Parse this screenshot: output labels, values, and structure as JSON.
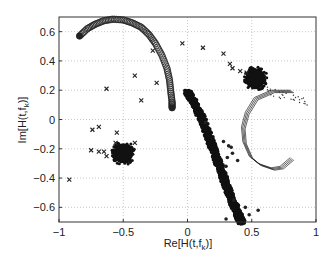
{
  "chart_data": {
    "type": "scatter",
    "title": "",
    "xlabel": "Re[H(t,f_k)]",
    "ylabel": "Im[H(t,f_k)]",
    "xlim": [
      -1,
      1
    ],
    "ylim": [
      -0.7,
      0.7
    ],
    "xticks": [
      -1,
      -0.5,
      0,
      0.5,
      1
    ],
    "xtick_labels": [
      "−1",
      "−0.5",
      "0",
      "0.5",
      "1"
    ],
    "yticks": [
      0.6,
      0.4,
      0.2,
      0,
      -0.2,
      -0.4,
      -0.6
    ],
    "ytick_labels": [
      "0.6",
      "0.4",
      "0.2",
      "0",
      "−0.2",
      "−0.4",
      "−0.6"
    ],
    "grid": true,
    "legend": null,
    "series": [
      {
        "name": "arc-circles",
        "marker": "o",
        "description": "Dense arc of open circles from about (-0.84, 0.57) over the top near (-0.55, 0.68) down to (-0.12, 0.08)",
        "points": [
          [
            -0.84,
            0.57
          ],
          [
            -0.78,
            0.62
          ],
          [
            -0.72,
            0.65
          ],
          [
            -0.65,
            0.675
          ],
          [
            -0.58,
            0.685
          ],
          [
            -0.5,
            0.68
          ],
          [
            -0.43,
            0.66
          ],
          [
            -0.36,
            0.63
          ],
          [
            -0.3,
            0.58
          ],
          [
            -0.25,
            0.52
          ],
          [
            -0.2,
            0.44
          ],
          [
            -0.16,
            0.35
          ],
          [
            -0.14,
            0.27
          ],
          [
            -0.13,
            0.19
          ],
          [
            -0.12,
            0.12
          ],
          [
            -0.12,
            0.08
          ]
        ]
      },
      {
        "name": "diagonal-band",
        "marker": ".",
        "description": "Dense diagonal band of filled dots from about (0.0, 0.19) down to (0.42, -0.7), with scattered outliers",
        "points": [
          [
            0.0,
            0.19
          ],
          [
            0.05,
            0.12
          ],
          [
            0.1,
            0.03
          ],
          [
            0.15,
            -0.08
          ],
          [
            0.2,
            -0.2
          ],
          [
            0.25,
            -0.32
          ],
          [
            0.3,
            -0.45
          ],
          [
            0.35,
            -0.56
          ],
          [
            0.4,
            -0.66
          ],
          [
            0.42,
            -0.7
          ]
        ],
        "outliers": [
          [
            0.14,
            -0.02
          ],
          [
            0.28,
            -0.15
          ],
          [
            0.32,
            -0.18
          ],
          [
            0.34,
            -0.19
          ],
          [
            0.31,
            -0.26
          ],
          [
            0.35,
            -0.23
          ],
          [
            0.39,
            -0.28
          ],
          [
            0.3,
            -0.32
          ],
          [
            0.36,
            -0.55
          ],
          [
            0.45,
            -0.6
          ],
          [
            0.48,
            -0.65
          ],
          [
            0.55,
            -0.62
          ],
          [
            0.3,
            -0.68
          ]
        ]
      },
      {
        "name": "cluster-left",
        "marker": "*",
        "description": "Dense blob centred near (-0.5, -0.23), radius ~0.07",
        "center": [
          -0.5,
          -0.23
        ]
      },
      {
        "name": "cluster-right",
        "marker": "*",
        "description": "Dense blob centred near (0.53, 0.28), radius ~0.06",
        "center": [
          0.53,
          0.28
        ]
      },
      {
        "name": "right-ring",
        "marker": "-",
        "description": "Thin-line spiral/ring from (0.55, 0.2) sweeping left to (0.42, -0.05) and down to (0.8, -0.32), with dotted tail to (0.95, 0.13)",
        "points": [
          [
            0.95,
            0.13
          ],
          [
            0.8,
            0.2
          ],
          [
            0.65,
            0.2
          ],
          [
            0.52,
            0.15
          ],
          [
            0.45,
            0.05
          ],
          [
            0.42,
            -0.05
          ],
          [
            0.43,
            -0.15
          ],
          [
            0.48,
            -0.25
          ],
          [
            0.55,
            -0.3
          ],
          [
            0.65,
            -0.33
          ],
          [
            0.72,
            -0.32
          ],
          [
            0.8,
            -0.26
          ]
        ]
      },
      {
        "name": "x-markers",
        "marker": "x",
        "points": [
          [
            -0.27,
            0.47
          ],
          [
            -0.04,
            0.52
          ],
          [
            0.12,
            0.49
          ],
          [
            0.28,
            0.45
          ],
          [
            0.33,
            0.38
          ],
          [
            0.35,
            0.35
          ],
          [
            0.41,
            0.33
          ],
          [
            0.46,
            0.32
          ],
          [
            -0.41,
            0.3
          ],
          [
            -0.24,
            0.25
          ],
          [
            -0.63,
            0.21
          ],
          [
            -0.36,
            0.13
          ],
          [
            -0.74,
            -0.07
          ],
          [
            -0.69,
            -0.05
          ],
          [
            -0.75,
            -0.21
          ],
          [
            -0.69,
            -0.22
          ],
          [
            -0.65,
            -0.22
          ],
          [
            -0.55,
            -0.09
          ],
          [
            -0.56,
            -0.16
          ],
          [
            -0.41,
            -0.16
          ],
          [
            -0.92,
            -0.41
          ],
          [
            -0.63,
            -0.25
          ]
        ]
      }
    ]
  }
}
